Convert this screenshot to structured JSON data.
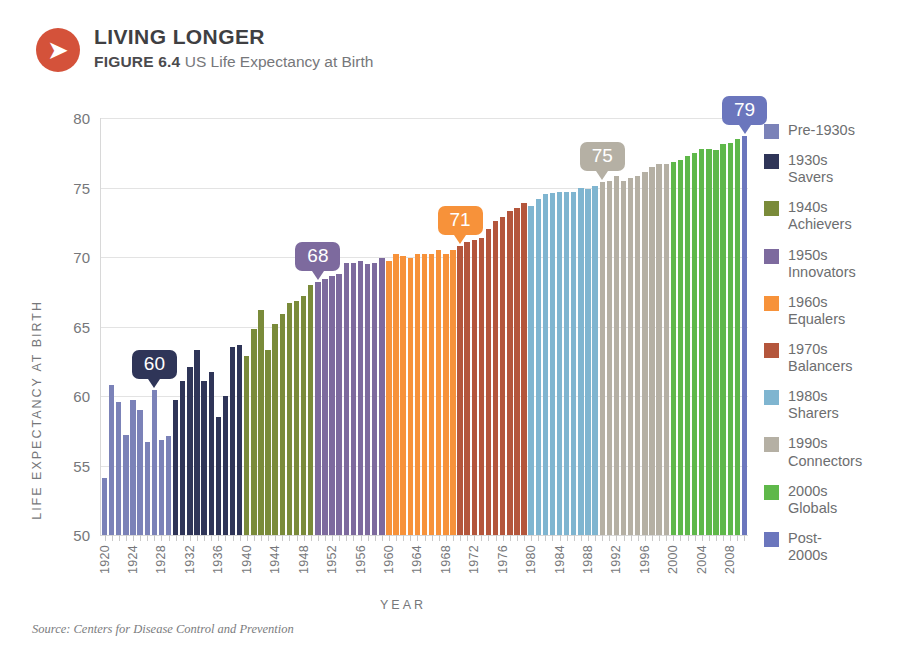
{
  "header": {
    "icon": "arrow-right-circle-icon",
    "arrow_glyph": "➤",
    "main_title": "LIVING LONGER",
    "figure_label": "FIGURE 6.4",
    "figure_description": "US Life Expectancy at Birth",
    "badge_color": "#d4523a"
  },
  "source": {
    "text": "Source: Centers for Disease Control and Prevention"
  },
  "chart_data": {
    "type": "bar",
    "title": "US Life Expectancy at Birth",
    "xlabel": "YEAR",
    "ylabel": "LIFE EXPECTANCY AT BIRTH",
    "ylim": [
      50,
      80
    ],
    "yticks": [
      50,
      55,
      60,
      65,
      70,
      75,
      80
    ],
    "ytick_labels": [
      "50",
      "55",
      "60",
      "65",
      "70",
      "75",
      "80"
    ],
    "xlim": [
      1920,
      2010
    ],
    "xtick_labels": [
      "1920",
      "1924",
      "1928",
      "1932",
      "1936",
      "1940",
      "1944",
      "1948",
      "1952",
      "1956",
      "1960",
      "1964",
      "1968",
      "1972",
      "1976",
      "1980",
      "1984",
      "1988",
      "1992",
      "1996",
      "2000",
      "2004",
      "2008"
    ],
    "grid": "horizontal",
    "legend_position": "right",
    "categories": [
      1920,
      1921,
      1922,
      1923,
      1924,
      1925,
      1926,
      1927,
      1928,
      1929,
      1930,
      1931,
      1932,
      1933,
      1934,
      1935,
      1936,
      1937,
      1938,
      1939,
      1940,
      1941,
      1942,
      1943,
      1944,
      1945,
      1946,
      1947,
      1948,
      1949,
      1950,
      1951,
      1952,
      1953,
      1954,
      1955,
      1956,
      1957,
      1958,
      1959,
      1960,
      1961,
      1962,
      1963,
      1964,
      1965,
      1966,
      1967,
      1968,
      1969,
      1970,
      1971,
      1972,
      1973,
      1974,
      1975,
      1976,
      1977,
      1978,
      1979,
      1980,
      1981,
      1982,
      1983,
      1984,
      1985,
      1986,
      1987,
      1988,
      1989,
      1990,
      1991,
      1992,
      1993,
      1994,
      1995,
      1996,
      1997,
      1998,
      1999,
      2000,
      2001,
      2002,
      2003,
      2004,
      2005,
      2006,
      2007,
      2008,
      2009,
      2010
    ],
    "values": [
      54.1,
      60.8,
      59.6,
      57.2,
      59.7,
      59.0,
      56.7,
      60.4,
      56.8,
      57.1,
      59.7,
      61.1,
      62.1,
      63.3,
      61.1,
      61.7,
      58.5,
      60.0,
      63.5,
      63.7,
      62.9,
      64.8,
      66.2,
      63.3,
      65.2,
      65.9,
      66.7,
      66.8,
      67.2,
      68.0,
      68.2,
      68.4,
      68.6,
      68.8,
      69.6,
      69.6,
      69.7,
      69.5,
      69.6,
      69.9,
      69.7,
      70.2,
      70.1,
      69.9,
      70.2,
      70.2,
      70.2,
      70.5,
      70.2,
      70.5,
      70.8,
      71.1,
      71.2,
      71.4,
      72.0,
      72.6,
      72.9,
      73.3,
      73.5,
      73.9,
      73.7,
      74.2,
      74.5,
      74.6,
      74.7,
      74.7,
      74.7,
      75.0,
      74.9,
      75.1,
      75.4,
      75.5,
      75.8,
      75.5,
      75.7,
      75.8,
      76.1,
      76.5,
      76.7,
      76.7,
      76.8,
      77.0,
      77.3,
      77.5,
      77.8,
      77.8,
      77.7,
      78.1,
      78.2,
      78.5,
      78.7
    ],
    "groups": [
      {
        "id": "pre-1930s",
        "label": "Pre-1930s",
        "label_lines": "Pre-1930s",
        "color": "#7b82b8",
        "start_year": 1920,
        "end_year": 1929
      },
      {
        "id": "1930s",
        "label": "1930s Savers",
        "label_lines": "1930s\nSavers",
        "color": "#2f3558",
        "start_year": 1930,
        "end_year": 1939
      },
      {
        "id": "1940s",
        "label": "1940s Achievers",
        "label_lines": "1940s\nAchievers",
        "color": "#7a8b3a",
        "start_year": 1940,
        "end_year": 1949
      },
      {
        "id": "1950s",
        "label": "1950s Innovators",
        "label_lines": "1950s\nInnovators",
        "color": "#7d6a9e",
        "start_year": 1950,
        "end_year": 1959
      },
      {
        "id": "1960s",
        "label": "1960s Equalers",
        "label_lines": "1960s\nEqualers",
        "color": "#f7923a",
        "start_year": 1960,
        "end_year": 1969
      },
      {
        "id": "1970s",
        "label": "1970s Balancers",
        "label_lines": "1970s\nBalancers",
        "color": "#b4563c",
        "start_year": 1970,
        "end_year": 1979
      },
      {
        "id": "1980s",
        "label": "1980s Sharers",
        "label_lines": "1980s\nSharers",
        "color": "#7fb5d0",
        "start_year": 1980,
        "end_year": 1989
      },
      {
        "id": "1990s",
        "label": "1990s Connectors",
        "label_lines": "1990s\nConnectors",
        "color": "#b5b0a4",
        "start_year": 1990,
        "end_year": 1999
      },
      {
        "id": "2000s",
        "label": "2000s Globals",
        "label_lines": "2000s\nGlobals",
        "color": "#5fb84a",
        "start_year": 2000,
        "end_year": 2009
      },
      {
        "id": "post-2000s",
        "label": "Post-2000s",
        "label_lines": "Post-\n2000s",
        "color": "#6b76bd",
        "start_year": 2010,
        "end_year": 2010
      }
    ],
    "annotations": [
      {
        "id": "callout-60",
        "text": "60",
        "year": 1927,
        "value": 60.4,
        "color": "#2f3558"
      },
      {
        "id": "callout-68",
        "text": "68",
        "year": 1950,
        "value": 68.2,
        "color": "#7d6a9e"
      },
      {
        "id": "callout-71",
        "text": "71",
        "year": 1970,
        "value": 70.8,
        "color": "#f7923a"
      },
      {
        "id": "callout-75",
        "text": "75",
        "year": 1990,
        "value": 75.4,
        "color": "#b5b0a4"
      },
      {
        "id": "callout-79",
        "text": "79",
        "year": 2010,
        "value": 78.7,
        "color": "#6b76bd"
      }
    ]
  }
}
